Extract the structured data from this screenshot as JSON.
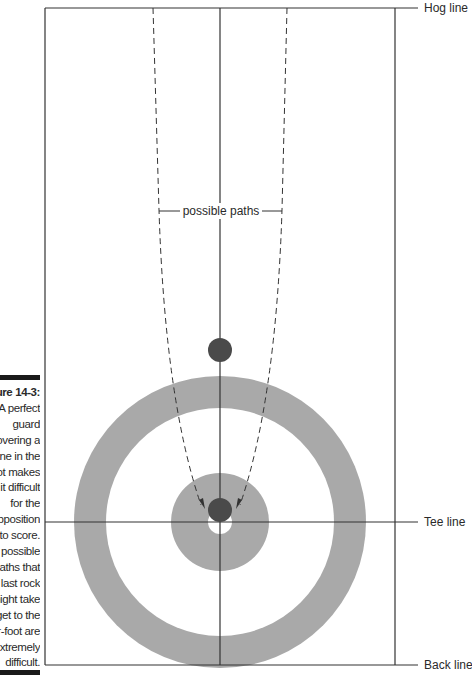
{
  "figure": {
    "caption_title": "Figure 14-3:",
    "caption_lines": [
      "A perfect",
      "guard",
      "covering a",
      "stone in the",
      "pot makes",
      "it difficult",
      "for the",
      "opposition",
      "to score.",
      "The possible",
      "paths that",
      "a last rock",
      "might take",
      "to get to the",
      "four-foot are",
      "extremely",
      "difficult."
    ]
  },
  "diagram": {
    "labels": {
      "hog_line": "Hog line",
      "tee_line": "Tee line",
      "back_line": "Back line",
      "possible_paths": "possible paths"
    },
    "colors": {
      "ring": "#a9a9a9",
      "rock": "#4a4a4a",
      "line": "#333333",
      "background": "#ffffff"
    },
    "house_center": [
      220,
      522
    ],
    "rings": [
      {
        "name": "twelve-foot",
        "radius": 146,
        "fill": "#a9a9a9"
      },
      {
        "name": "eight-foot",
        "radius": 114,
        "fill": "#ffffff"
      },
      {
        "name": "four-foot",
        "radius": 49,
        "fill": "#a9a9a9"
      },
      {
        "name": "button",
        "radius": 12,
        "fill": "#ffffff"
      }
    ],
    "rocks": [
      {
        "name": "guard-rock",
        "x": 220,
        "y": 350,
        "r": 12
      },
      {
        "name": "shot-rock",
        "x": 220,
        "y": 510,
        "r": 12
      }
    ]
  }
}
